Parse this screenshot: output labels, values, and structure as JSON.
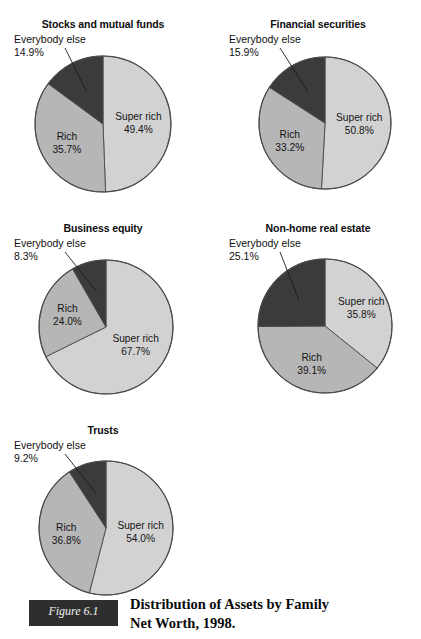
{
  "figure": {
    "tag": "Figure 6.1",
    "caption_line1": "Distribution of Assets by Family",
    "caption_line2": "Net Worth, 1998."
  },
  "colors": {
    "super_rich": "#d2d2d2",
    "rich": "#b6b6b6",
    "everybody_else": "#3b3b3b",
    "outline": "#4a4a4a",
    "text": "#111111"
  },
  "legend_terms": {
    "super_rich": "Super rich",
    "rich": "Rich",
    "everybody_else": "Everybody else"
  },
  "chart_data": [
    {
      "type": "pie",
      "title": "Stocks and mutual funds",
      "categories": [
        "Super rich",
        "Rich",
        "Everybody else"
      ],
      "values": [
        49.4,
        35.7,
        14.9
      ],
      "labels": [
        "49.4%",
        "35.7%",
        "14.9%"
      ],
      "colors": [
        "#d2d2d2",
        "#b6b6b6",
        "#3b3b3b"
      ],
      "callout_name": "Everybody else",
      "callout_value": "14.9%",
      "start_angle_deg": 0,
      "direction": "clockwise"
    },
    {
      "type": "pie",
      "title": "Financial securities",
      "categories": [
        "Super rich",
        "Rich",
        "Everybody else"
      ],
      "values": [
        50.8,
        33.2,
        15.9
      ],
      "labels": [
        "50.8%",
        "33.2%",
        "15.9%"
      ],
      "colors": [
        "#d2d2d2",
        "#b6b6b6",
        "#3b3b3b"
      ],
      "callout_name": "Everybody else",
      "callout_value": "15.9%",
      "start_angle_deg": 0,
      "direction": "clockwise"
    },
    {
      "type": "pie",
      "title": "Business equity",
      "categories": [
        "Super rich",
        "Rich",
        "Everybody else"
      ],
      "values": [
        67.7,
        24.0,
        8.3
      ],
      "labels": [
        "67.7%",
        "24.0%",
        "8.3%"
      ],
      "colors": [
        "#d2d2d2",
        "#b6b6b6",
        "#3b3b3b"
      ],
      "callout_name": "Everybody else",
      "callout_value": "8.3%",
      "start_angle_deg": 0,
      "direction": "clockwise"
    },
    {
      "type": "pie",
      "title": "Non-home real estate",
      "categories": [
        "Super rich",
        "Rich",
        "Everybody else"
      ],
      "values": [
        35.8,
        39.1,
        25.1
      ],
      "labels": [
        "35.8%",
        "39.1%",
        "25.1%"
      ],
      "colors": [
        "#d2d2d2",
        "#b6b6b6",
        "#3b3b3b"
      ],
      "callout_name": "Everybody else",
      "callout_value": "25.1%",
      "start_angle_deg": 0,
      "direction": "clockwise"
    },
    {
      "type": "pie",
      "title": "Trusts",
      "categories": [
        "Super rich",
        "Rich",
        "Everybody else"
      ],
      "values": [
        54.0,
        36.8,
        9.2
      ],
      "labels": [
        "54.0%",
        "36.8%",
        "9.2%"
      ],
      "colors": [
        "#d2d2d2",
        "#b6b6b6",
        "#3b3b3b"
      ],
      "callout_name": "Everybody else",
      "callout_value": "9.2%",
      "start_angle_deg": 0,
      "direction": "clockwise"
    }
  ],
  "panels": [
    {
      "chart_index": 0,
      "title": "Stocks and mutual funds",
      "callout_name": "Everybody else",
      "callout_value": "14.9%",
      "slice_labels": [
        {
          "name": "Super rich",
          "value": "49.4%"
        },
        {
          "name": "Rich",
          "value": "35.7%"
        },
        {
          "name": "Everybody else",
          "value": "14.9%"
        }
      ]
    },
    {
      "chart_index": 1,
      "title": "Financial securities",
      "callout_name": "Everybody else",
      "callout_value": "15.9%",
      "slice_labels": [
        {
          "name": "Super rich",
          "value": "50.8%"
        },
        {
          "name": "Rich",
          "value": "33.2%"
        },
        {
          "name": "Everybody else",
          "value": "15.9%"
        }
      ]
    },
    {
      "chart_index": 2,
      "title": "Business equity",
      "callout_name": "Everybody else",
      "callout_value": "8.3%",
      "slice_labels": [
        {
          "name": "Super rich",
          "value": "67.7%"
        },
        {
          "name": "Rich",
          "value": "24.0%"
        },
        {
          "name": "Everybody else",
          "value": "8.3%"
        }
      ]
    },
    {
      "chart_index": 3,
      "title": "Non-home real estate",
      "callout_name": "Everybody else",
      "callout_value": "25.1%",
      "slice_labels": [
        {
          "name": "Super rich",
          "value": "35.8%"
        },
        {
          "name": "Rich",
          "value": "39.1%"
        },
        {
          "name": "Everybody else",
          "value": "25.1%"
        }
      ]
    },
    {
      "chart_index": 4,
      "title": "Trusts",
      "callout_name": "Everybody else",
      "callout_value": "9.2%",
      "slice_labels": [
        {
          "name": "Super rich",
          "value": "54.0%"
        },
        {
          "name": "Rich",
          "value": "36.8%"
        },
        {
          "name": "Everybody else",
          "value": "9.2%"
        }
      ]
    }
  ]
}
